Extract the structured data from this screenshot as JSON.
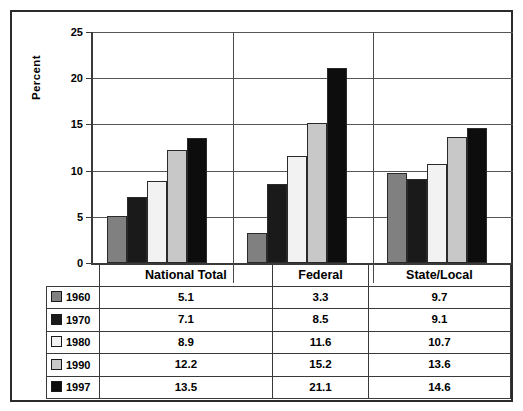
{
  "chart_data": {
    "type": "bar",
    "title": "",
    "subtitle": "",
    "xlabel": "",
    "ylabel": "Percent",
    "ylim": [
      0,
      25
    ],
    "yticks": [
      0,
      5,
      10,
      15,
      20,
      25
    ],
    "grid": true,
    "legend_position": "table-left",
    "categories": [
      "National Total",
      "Federal",
      "State/Local"
    ],
    "series": [
      {
        "name": "1960",
        "values": [
          5.1,
          3.3,
          9.7
        ],
        "color": "#808080"
      },
      {
        "name": "1970",
        "values": [
          7.1,
          8.5,
          9.1
        ],
        "color": "#1a1a1a"
      },
      {
        "name": "1980",
        "values": [
          8.9,
          11.6,
          10.7
        ],
        "color": "#f2f2f2"
      },
      {
        "name": "1990",
        "values": [
          12.2,
          15.2,
          13.6
        ],
        "color": "#c8c8c8"
      },
      {
        "name": "1997",
        "values": [
          13.5,
          21.1,
          14.6
        ],
        "color": "#0d0d0d"
      }
    ]
  },
  "axis": {
    "ylabel": "Percent",
    "tick_labels": [
      "25",
      "20",
      "15",
      "10",
      "5",
      "0"
    ]
  },
  "table": {
    "column_headers": [
      "",
      "National Total",
      "Federal",
      "State/Local"
    ],
    "rows": [
      {
        "label": "1960",
        "swatch": "legend-swatch-1960",
        "values": [
          "5.1",
          "3.3",
          "9.7"
        ]
      },
      {
        "label": "1970",
        "swatch": "legend-swatch-1970",
        "values": [
          "7.1",
          "8.5",
          "9.1"
        ]
      },
      {
        "label": "1980",
        "swatch": "legend-swatch-1980",
        "values": [
          "11.6",
          "11.6",
          "10.7"
        ]
      },
      {
        "label": "1990",
        "swatch": "legend-swatch-1990",
        "values": [
          "12.2",
          "15.2",
          "13.6"
        ]
      },
      {
        "label": "1997",
        "swatch": "legend-swatch-1997",
        "values": [
          "13.5",
          "21.1",
          "14.6"
        ]
      }
    ]
  },
  "table_fixed": {
    "r0": [
      "5.1",
      "3.3",
      "9.7"
    ],
    "r1": [
      "7.1",
      "8.5",
      "9.1"
    ],
    "r2": [
      "8.9",
      "11.6",
      "10.7"
    ],
    "r3": [
      "12.2",
      "15.2",
      "13.6"
    ],
    "r4": [
      "13.5",
      "21.1",
      "14.6"
    ]
  }
}
